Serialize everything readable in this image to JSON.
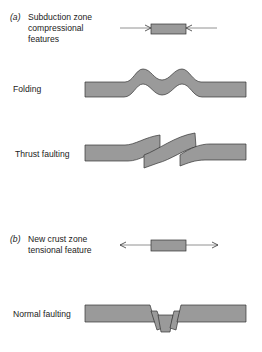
{
  "section_a": {
    "tag": "(a)",
    "title_line1": "Subduction zone",
    "title_line2": "compressional",
    "title_line3": "features"
  },
  "section_b": {
    "tag": "(b)",
    "title_line1": "New crust zone",
    "title_line2": "tensional feature"
  },
  "labels": {
    "folding": "Folding",
    "thrust": "Thrust faulting",
    "normal": "Normal faulting"
  },
  "colors": {
    "fill": "#9a9a9a",
    "stroke": "#333333",
    "line": "#777777"
  }
}
